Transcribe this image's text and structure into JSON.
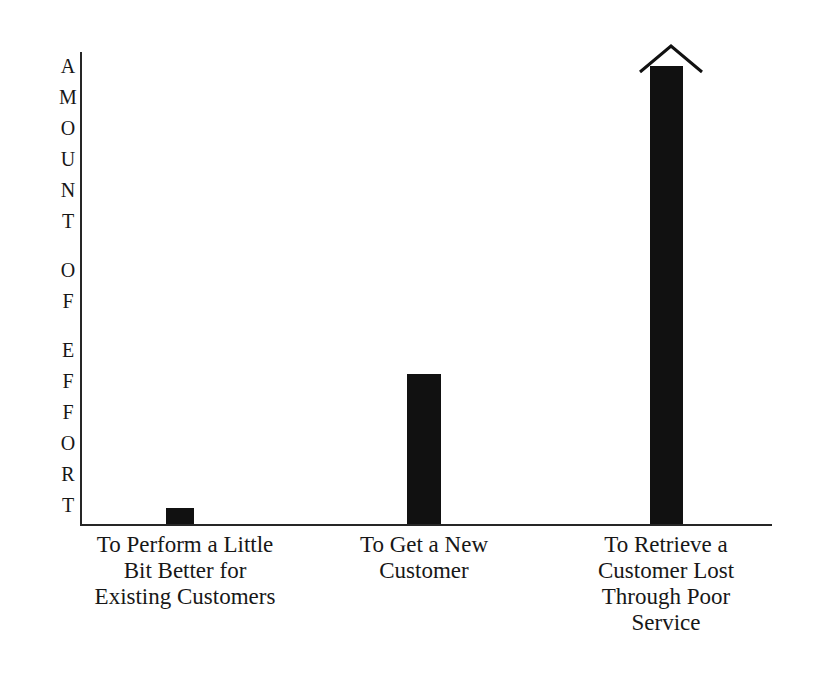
{
  "chart_data": {
    "type": "bar",
    "title": "",
    "subtitle": "",
    "xlabel": "",
    "ylabel": "AMOUNT OF EFFORT",
    "categories": [
      "To Perform a Little Bit Better for Existing Customers",
      "To Get a New Customer",
      "To Retrieve a Customer Lost Through Poor Service"
    ],
    "category_lines": [
      [
        "To Perform a Little",
        "Bit Better for",
        "Existing Customers"
      ],
      [
        "To Get a New",
        "Customer"
      ],
      [
        "To Retrieve a",
        "Customer Lost",
        "Through Poor",
        "Service"
      ]
    ],
    "values": [
      3.5,
      32.7,
      100
    ],
    "value_unit": "relative effort (unlabeled axis, estimated from bar heights)",
    "ylim": [
      0,
      100
    ],
    "grid": false,
    "legend": false,
    "tick_labels": [],
    "annotations": [
      {
        "target_category": "To Retrieve a Customer Lost Through Poor Service",
        "type": "arrowhead-up",
        "meaning": "bar extends beyond the top of the chart"
      }
    ],
    "bar_color": "#111111",
    "axis_color": "#262626",
    "background_color": "#ffffff"
  },
  "axis_title": {
    "text": "AMOUNT OF EFFORT",
    "orientation": "vertical-stacked-letters",
    "letters": [
      "A",
      "M",
      "O",
      "U",
      "N",
      "T",
      " ",
      "O",
      "F",
      " ",
      "E",
      "F",
      "F",
      "O",
      "R",
      "T"
    ]
  },
  "bars": [
    {
      "name": "bar-perform-a-little-bit-better",
      "value": 3.5
    },
    {
      "name": "bar-get-a-new-customer",
      "value": 32.7
    },
    {
      "name": "bar-retrieve-a-lost-customer",
      "value": 100
    }
  ]
}
